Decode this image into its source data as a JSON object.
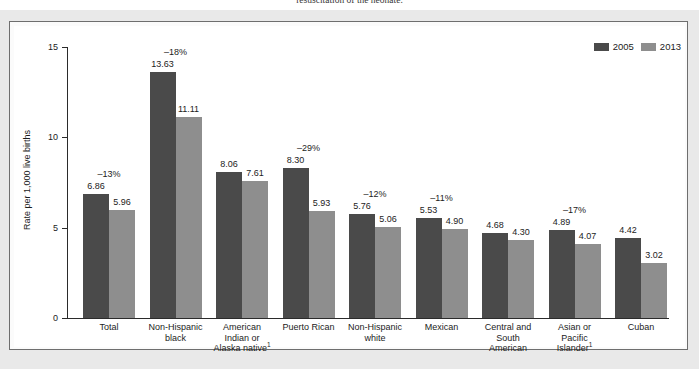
{
  "caption": "resuscitation of the neonate.",
  "legend": {
    "entries": [
      {
        "label": "2005",
        "color": "#4a4a4a"
      },
      {
        "label": "2013",
        "color": "#8e8e8e"
      }
    ]
  },
  "chart_data": {
    "type": "bar",
    "title": "",
    "xlabel": "",
    "ylabel": "Rate per 1,000 live births",
    "ylim": [
      0,
      15
    ],
    "yticks": [
      0,
      5,
      10,
      15
    ],
    "ytick_labels": [
      "0",
      "5",
      "10",
      "15"
    ],
    "grid": false,
    "legend_position": "top-right",
    "categories": [
      "Total",
      "Non-Hispanic black",
      "American Indian or Alaska native¹",
      "Puerto Rican",
      "Non-Hispanic white",
      "Mexican",
      "Central and South American",
      "Asian or Pacific Islander¹",
      "Cuban"
    ],
    "category_lines": [
      [
        "Total"
      ],
      [
        "Non-Hispanic",
        "black"
      ],
      [
        "American",
        "Indian or",
        "Alaska native"
      ],
      [
        "Puerto Rican"
      ],
      [
        "Non-Hispanic",
        "white"
      ],
      [
        "Mexican"
      ],
      [
        "Central and",
        "South",
        "American"
      ],
      [
        "Asian or",
        "Pacific",
        "Islander"
      ],
      [
        "Cuban"
      ]
    ],
    "series": [
      {
        "name": "2005",
        "color": "#4a4a4a",
        "values": [
          6.86,
          13.63,
          8.06,
          8.3,
          5.76,
          5.53,
          4.68,
          4.89,
          4.42
        ]
      },
      {
        "name": "2013",
        "color": "#8e8e8e",
        "values": [
          5.96,
          11.11,
          7.61,
          5.93,
          5.06,
          4.9,
          4.3,
          4.07,
          3.02
        ]
      }
    ],
    "percent_change_labels": [
      "–13%",
      "–18%",
      "",
      "–29%",
      "–12%",
      "–11%",
      "",
      "–17%",
      ""
    ]
  }
}
